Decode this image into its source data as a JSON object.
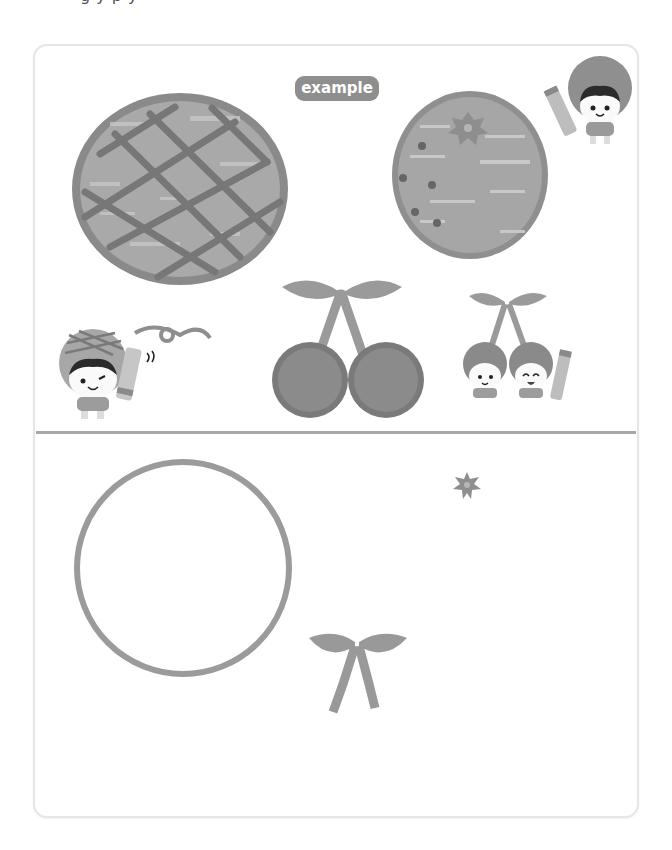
{
  "page": {
    "cut_text": "g                    y                   p                                                          y"
  },
  "example_section": {
    "badge_label": "example",
    "items": [
      {
        "name": "lattice-pie",
        "description": "pie with lattice crust"
      },
      {
        "name": "flower-pie",
        "description": "orange-style tart with flower"
      },
      {
        "name": "cherries",
        "description": "pair of cherries with leaves"
      },
      {
        "name": "cherry-kids",
        "description": "two cherry characters with crayon"
      }
    ],
    "characters": [
      {
        "name": "orange-kid-with-crayon"
      },
      {
        "name": "pie-kid-winking-with-crayon"
      }
    ]
  },
  "practice_section": {
    "items": [
      {
        "name": "empty-circle-outline"
      },
      {
        "name": "flower-sticker"
      },
      {
        "name": "leaf-ribbon-stem"
      }
    ]
  },
  "colors": {
    "card_border": "#e6e6e6",
    "divider": "#a8a8a8",
    "badge_bg": "#8e8e8e",
    "pie_fill": "#a9a9a9",
    "pie_rim": "#8a8a8a",
    "lattice": "#777777",
    "cherry": "#7d7d7d",
    "leaf": "#9a9a9a",
    "outline": "#9b9b9b"
  }
}
